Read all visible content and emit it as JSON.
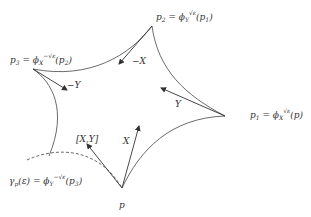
{
  "diagram": {
    "type": "holonomy-commutator-loop",
    "stroke_color": "#444444",
    "points": {
      "p": {
        "label": "p"
      },
      "p1": {
        "label_main": "p",
        "label_sub": "1",
        "label_eq": " = ϕ",
        "label_phi_sub": "X",
        "label_phi_sup": "√ε",
        "label_arg": "(p)"
      },
      "p2": {
        "label_main": "p",
        "label_sub": "2",
        "label_eq": " = ϕ",
        "label_phi_sub": "Y",
        "label_phi_sup": "√ε",
        "label_arg": "(p",
        "label_arg_sub": "1",
        "label_arg_end": ")"
      },
      "p3": {
        "label_main": "p",
        "label_sub": "3",
        "label_eq": " = ϕ",
        "label_phi_sub": "X",
        "label_phi_sup": "−√ε",
        "label_arg": "(p",
        "label_arg_sub": "2",
        "label_arg_end": ")"
      }
    },
    "vectors": {
      "X": "X",
      "Y": "Y",
      "neg_X": "−X",
      "neg_Y": "−Y",
      "bracket": "[X,Y]"
    },
    "gamma": {
      "main": "γ",
      "sub": "p",
      "arg": "(ε) = ϕ",
      "phi_sub": "Y",
      "phi_sup": "−√ε",
      "tail": "(p",
      "tail_sub": "3",
      "tail_end": ")"
    }
  }
}
